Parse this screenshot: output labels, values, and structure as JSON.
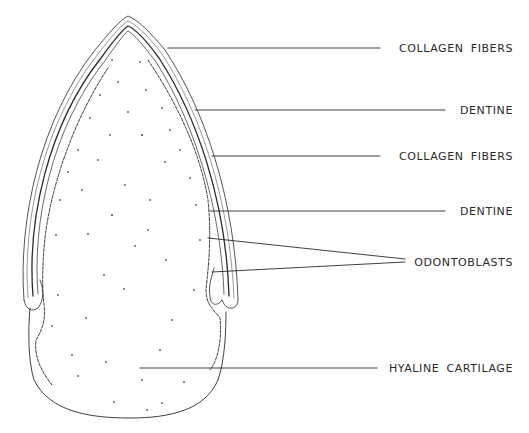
{
  "figure": {
    "ink_color": "#2a2a2a",
    "background": "#ffffff"
  },
  "labels": [
    {
      "id": "collagen-fibers-1",
      "text": "COLLAGEN FIBERS",
      "y": 48,
      "line": [
        [
          168,
          48
        ],
        [
          380,
          48
        ]
      ]
    },
    {
      "id": "dentine-1",
      "text": "DENTINE",
      "y": 110,
      "line": [
        [
          195,
          110
        ],
        [
          445,
          110
        ]
      ]
    },
    {
      "id": "collagen-fibers-2",
      "text": "COLLAGEN FIBERS",
      "y": 156,
      "line": [
        [
          212,
          156
        ],
        [
          380,
          156
        ]
      ]
    },
    {
      "id": "dentine-2",
      "text": "DENTINE",
      "y": 211,
      "line": [
        [
          210,
          211
        ],
        [
          445,
          211
        ]
      ]
    },
    {
      "id": "odontoblasts",
      "text": "ODONTOBLASTS",
      "y": 262,
      "lines": [
        [
          [
            208,
            238
          ],
          [
            405,
            260
          ]
        ],
        [
          [
            212,
            272
          ],
          [
            405,
            262
          ]
        ]
      ]
    },
    {
      "id": "hyaline-cartilage",
      "text": "HYALINE CARTILAGE",
      "y": 368,
      "line": [
        [
          140,
          368
        ],
        [
          377,
          368
        ]
      ]
    }
  ]
}
